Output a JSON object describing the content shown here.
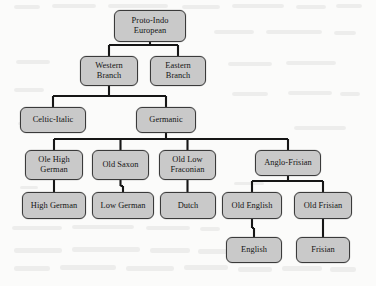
{
  "diagram": {
    "type": "tree",
    "orientation": "top-down",
    "node_fill_color": "#c9c9c9",
    "node_border_color": "#3a3a3a",
    "connector_color": "#161616",
    "background_color": "#fbfbfa",
    "nodes": [
      {
        "id": "proto",
        "label": "Proto-Indo\nEuropean",
        "level": 0,
        "x": 114,
        "y": 10,
        "w": 72,
        "h": 32
      },
      {
        "id": "western",
        "label": "Western\nBranch",
        "level": 1,
        "x": 80,
        "y": 56,
        "w": 58,
        "h": 30
      },
      {
        "id": "eastern",
        "label": "Eastern\nBranch",
        "level": 1,
        "x": 150,
        "y": 56,
        "w": 56,
        "h": 30
      },
      {
        "id": "celtic-italic",
        "label": "Celtic-Italic",
        "level": 2,
        "x": 20,
        "y": 107,
        "w": 66,
        "h": 26
      },
      {
        "id": "germanic",
        "label": "Germanic",
        "level": 2,
        "x": 136,
        "y": 107,
        "w": 60,
        "h": 26
      },
      {
        "id": "ole-high-german",
        "label": "Ole High\nGerman",
        "level": 3,
        "x": 25,
        "y": 150,
        "w": 58,
        "h": 30
      },
      {
        "id": "old-saxon",
        "label": "Old Saxon",
        "level": 3,
        "x": 92,
        "y": 150,
        "w": 57,
        "h": 30
      },
      {
        "id": "old-low-fraconian",
        "label": "Old Low\nFraconian",
        "level": 3,
        "x": 159,
        "y": 150,
        "w": 57,
        "h": 30
      },
      {
        "id": "anglo-frisian",
        "label": "Anglo-Frisian",
        "level": 3,
        "x": 255,
        "y": 150,
        "w": 66,
        "h": 26
      },
      {
        "id": "high-german",
        "label": "High German",
        "level": 4,
        "x": 22,
        "y": 192,
        "w": 64,
        "h": 27
      },
      {
        "id": "low-german",
        "label": "Low German",
        "level": 4,
        "x": 92,
        "y": 192,
        "w": 62,
        "h": 27
      },
      {
        "id": "dutch",
        "label": "Dutch",
        "level": 4,
        "x": 160,
        "y": 192,
        "w": 56,
        "h": 27
      },
      {
        "id": "old-english",
        "label": "Old English",
        "level": 4,
        "x": 222,
        "y": 192,
        "w": 60,
        "h": 27
      },
      {
        "id": "old-frisian",
        "label": "Old Frisian",
        "level": 4,
        "x": 294,
        "y": 192,
        "w": 58,
        "h": 27
      },
      {
        "id": "english",
        "label": "English",
        "level": 5,
        "x": 226,
        "y": 237,
        "w": 56,
        "h": 26
      },
      {
        "id": "frisian",
        "label": "Frisian",
        "level": 5,
        "x": 296,
        "y": 237,
        "w": 54,
        "h": 26
      }
    ],
    "edges": [
      {
        "from": "proto",
        "to": "western"
      },
      {
        "from": "proto",
        "to": "eastern"
      },
      {
        "from": "western",
        "to": "celtic-italic"
      },
      {
        "from": "western",
        "to": "germanic"
      },
      {
        "from": "germanic",
        "to": "ole-high-german"
      },
      {
        "from": "germanic",
        "to": "old-saxon"
      },
      {
        "from": "germanic",
        "to": "old-low-fraconian"
      },
      {
        "from": "germanic",
        "to": "anglo-frisian"
      },
      {
        "from": "ole-high-german",
        "to": "high-german"
      },
      {
        "from": "old-saxon",
        "to": "low-german"
      },
      {
        "from": "old-low-fraconian",
        "to": "dutch"
      },
      {
        "from": "anglo-frisian",
        "to": "old-english"
      },
      {
        "from": "anglo-frisian",
        "to": "old-frisian"
      },
      {
        "from": "old-english",
        "to": "english"
      },
      {
        "from": "old-frisian",
        "to": "frisian"
      }
    ]
  },
  "artifacts": [
    {
      "x": 14,
      "y": 5,
      "w": 26,
      "h": 4
    },
    {
      "x": 52,
      "y": 4,
      "w": 44,
      "h": 4
    },
    {
      "x": 108,
      "y": 4,
      "w": 60,
      "h": 4
    },
    {
      "x": 182,
      "y": 5,
      "w": 38,
      "h": 4
    },
    {
      "x": 232,
      "y": 4,
      "w": 52,
      "h": 4
    },
    {
      "x": 296,
      "y": 5,
      "w": 30,
      "h": 4
    },
    {
      "x": 336,
      "y": 4,
      "w": 26,
      "h": 4
    },
    {
      "x": 214,
      "y": 30,
      "w": 40,
      "h": 4
    },
    {
      "x": 266,
      "y": 30,
      "w": 56,
      "h": 4
    },
    {
      "x": 334,
      "y": 31,
      "w": 22,
      "h": 4
    },
    {
      "x": 16,
      "y": 60,
      "w": 34,
      "h": 4
    },
    {
      "x": 228,
      "y": 62,
      "w": 44,
      "h": 4
    },
    {
      "x": 286,
      "y": 61,
      "w": 50,
      "h": 4
    },
    {
      "x": 14,
      "y": 88,
      "w": 30,
      "h": 4
    },
    {
      "x": 232,
      "y": 92,
      "w": 36,
      "h": 4
    },
    {
      "x": 288,
      "y": 91,
      "w": 44,
      "h": 4
    },
    {
      "x": 340,
      "y": 92,
      "w": 20,
      "h": 4
    },
    {
      "x": 18,
      "y": 122,
      "w": 24,
      "h": 3
    },
    {
      "x": 294,
      "y": 126,
      "w": 52,
      "h": 4
    },
    {
      "x": 20,
      "y": 186,
      "w": 18,
      "h": 3
    },
    {
      "x": 234,
      "y": 182,
      "w": 30,
      "h": 3
    },
    {
      "x": 12,
      "y": 226,
      "w": 50,
      "h": 4
    },
    {
      "x": 72,
      "y": 225,
      "w": 62,
      "h": 4
    },
    {
      "x": 146,
      "y": 226,
      "w": 44,
      "h": 4
    },
    {
      "x": 200,
      "y": 227,
      "w": 20,
      "h": 4
    },
    {
      "x": 14,
      "y": 248,
      "w": 48,
      "h": 5
    },
    {
      "x": 72,
      "y": 247,
      "w": 68,
      "h": 5
    },
    {
      "x": 150,
      "y": 248,
      "w": 40,
      "h": 5
    },
    {
      "x": 198,
      "y": 249,
      "w": 30,
      "h": 5
    },
    {
      "x": 14,
      "y": 266,
      "w": 36,
      "h": 5
    },
    {
      "x": 60,
      "y": 265,
      "w": 56,
      "h": 5
    },
    {
      "x": 126,
      "y": 266,
      "w": 48,
      "h": 5
    },
    {
      "x": 184,
      "y": 265,
      "w": 44,
      "h": 5
    },
    {
      "x": 238,
      "y": 267,
      "w": 34,
      "h": 5
    },
    {
      "x": 282,
      "y": 266,
      "w": 40,
      "h": 5
    },
    {
      "x": 330,
      "y": 267,
      "w": 26,
      "h": 5
    }
  ]
}
